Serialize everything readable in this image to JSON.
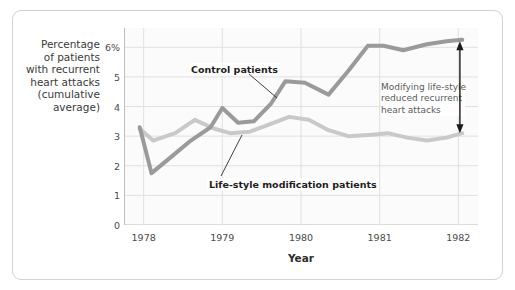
{
  "chart_data": {
    "type": "line",
    "title": "",
    "xlabel": "Year",
    "ylabel": "Percentage of patients with recurrent heart attacks (cumulative average)",
    "ylabel_lines": [
      "Percentage",
      "of patients",
      "with recurrent",
      "heart attacks",
      "(cumulative",
      "average)"
    ],
    "xlim": [
      1977.75,
      1982.25
    ],
    "ylim": [
      0,
      6.65
    ],
    "yticks": [
      0,
      1,
      2,
      3,
      4,
      5,
      6
    ],
    "ytick_labels": [
      "0",
      "1",
      "2",
      "3",
      "4",
      "5",
      "6%"
    ],
    "xticks": [
      1978,
      1979,
      1980,
      1981,
      1982
    ],
    "xtick_labels": [
      "1978",
      "1979",
      "1980",
      "1981",
      "1982"
    ],
    "x_minor_ticks_per_interval": 4,
    "grid": "horizontal-and-vertical-major",
    "legend": "inline-labels",
    "series": [
      {
        "name": "Control patients",
        "color": "#9a9a9a",
        "x": [
          1977.95,
          1978.1,
          1978.35,
          1978.6,
          1978.85,
          1979.0,
          1979.2,
          1979.4,
          1979.62,
          1979.8,
          1980.05,
          1980.35,
          1980.6,
          1980.85,
          1981.05,
          1981.3,
          1981.6,
          1981.85,
          1982.05
        ],
        "values": [
          3.3,
          1.75,
          2.3,
          2.85,
          3.3,
          3.95,
          3.45,
          3.5,
          4.1,
          4.85,
          4.8,
          4.4,
          5.2,
          6.05,
          6.05,
          5.9,
          6.1,
          6.2,
          6.25
        ]
      },
      {
        "name": "Life-style modification patients",
        "color": "#c9c9c9",
        "x": [
          1977.95,
          1978.12,
          1978.4,
          1978.65,
          1978.9,
          1979.1,
          1979.35,
          1979.6,
          1979.85,
          1980.1,
          1980.35,
          1980.6,
          1980.9,
          1981.1,
          1981.35,
          1981.6,
          1981.85,
          1982.05
        ],
        "values": [
          3.25,
          2.85,
          3.1,
          3.55,
          3.25,
          3.1,
          3.15,
          3.4,
          3.65,
          3.55,
          3.2,
          3.0,
          3.05,
          3.1,
          2.95,
          2.85,
          2.95,
          3.1
        ]
      }
    ],
    "annotations": [
      {
        "name": "control-patients-label",
        "text": "Control patients",
        "kind": "series-label"
      },
      {
        "name": "lifestyle-patients-label",
        "text": "Life-style modification patients",
        "kind": "series-label"
      },
      {
        "name": "gap-callout",
        "lines": [
          "Modifying life-style",
          "reduced recurrent",
          "heart attacks"
        ],
        "kind": "callout",
        "arrow": "double-headed-vertical",
        "arrow_from_value": 6.2,
        "arrow_to_value": 3.1,
        "arrow_at_year": 1982.02
      }
    ],
    "colors": {
      "control_line": "#9a9a9a",
      "lifestyle_line": "#c9c9c9",
      "grid": "#e0e0e0",
      "axis": "#bdbdbd",
      "plot_background": "#fbfbfb",
      "frame_border": "#d2d2d2",
      "text": "#3b3b3b",
      "callout_text": "#5a5a5a",
      "arrow": "#1a1a1a"
    }
  },
  "axis": {
    "x_title": "Year"
  }
}
